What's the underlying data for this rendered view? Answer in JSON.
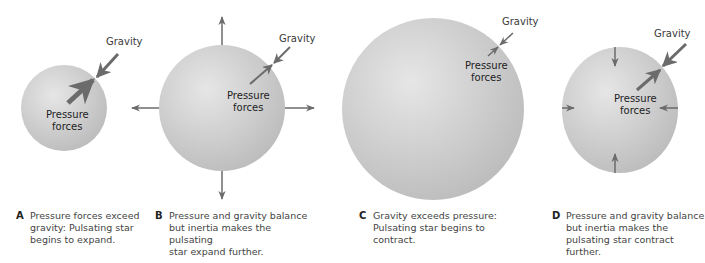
{
  "figure": {
    "panels": [
      {
        "letter": "A",
        "gravity_label": "Gravity",
        "pressure_label_1": "Pressure",
        "pressure_label_2": "forces",
        "caption_1": "Pressure forces exceed",
        "caption_2": "gravity: Pulsating star",
        "caption_3": "begins to expand."
      },
      {
        "letter": "B",
        "gravity_label": "Gravity",
        "pressure_label_1": "Pressure",
        "pressure_label_2": "forces",
        "caption_1": "Pressure and gravity balance",
        "caption_2": "but inertia makes the pulsating",
        "caption_3": "star expand further."
      },
      {
        "letter": "C",
        "gravity_label": "Gravity",
        "pressure_label_1": "Pressure",
        "pressure_label_2": "forces",
        "caption_1": "Gravity exceeds pressure:",
        "caption_2": "Pulsating star begins to contract."
      },
      {
        "letter": "D",
        "gravity_label": "Gravity",
        "pressure_label_1": "Pressure",
        "pressure_label_2": "forces",
        "caption_1": "Pressure and gravity balance",
        "caption_2": "but inertia makes the",
        "caption_3": "pulsating star contract further."
      }
    ],
    "colors": {
      "star_light": "#e4e4e4",
      "star_dark": "#bdbdbd",
      "arrow": "#6b6b6b"
    }
  }
}
